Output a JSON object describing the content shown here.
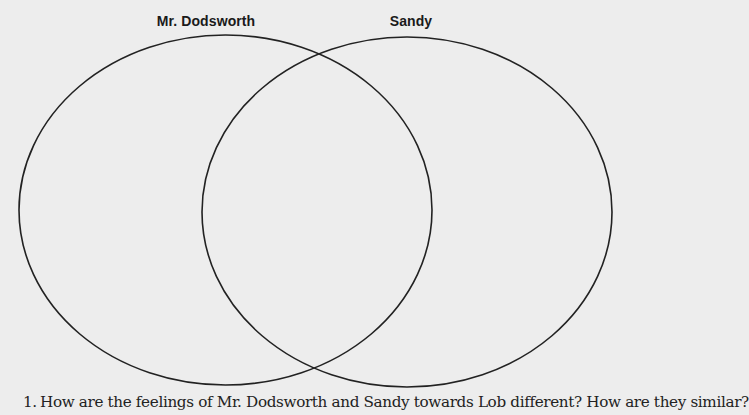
{
  "venn": {
    "sets": [
      {
        "label": "Mr. Dodsworth"
      },
      {
        "label": "Sandy"
      }
    ],
    "stroke_color": "#222222",
    "background_color": "#ededed"
  },
  "questions": [
    {
      "number": "1.",
      "text": "How are the feelings of Mr. Dodsworth and Sandy towards Lob different? How are they similar?"
    }
  ]
}
